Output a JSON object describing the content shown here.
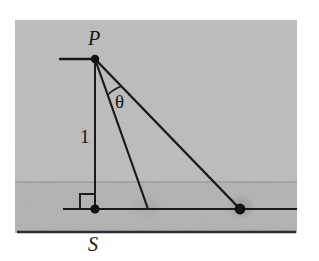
{
  "figure": {
    "panel": {
      "x": 15,
      "y": 20,
      "width": 282,
      "height": 213,
      "upper_fill": "#bcbcbc",
      "lower_fill": "#b2b2b2",
      "band_divider_y": 182,
      "border_color": "#6f6f6f"
    },
    "stroke_color": "#1a1a1a",
    "labels": {
      "apex": "P",
      "angle": "θ",
      "height": "1",
      "base_point": "S"
    },
    "points": {
      "apex": {
        "name": "P",
        "x": 95,
        "y": 59,
        "dot": true,
        "dot_r": 4.2
      },
      "foot": {
        "name": "S",
        "x": 95,
        "y": 209,
        "dot": true,
        "dot_r": 4.6
      },
      "near_target": {
        "name": "near-ray-endpoint",
        "x": 148,
        "y": 209,
        "dot": false
      },
      "far_target": {
        "name": "far-ray-endpoint",
        "x": 240,
        "y": 209,
        "dot": true,
        "dot_r": 5.4
      }
    },
    "segments": {
      "apex_tick": {
        "x1": 60,
        "y1": 59,
        "x2": 95,
        "y2": 59,
        "width": 2.4
      },
      "height_line": {
        "x1": 95,
        "y1": 59,
        "x2": 95,
        "y2": 209,
        "width": 2.0
      },
      "ground_line": {
        "x1": 63,
        "y1": 209,
        "x2": 297,
        "y2": 209,
        "width": 2.0
      },
      "near_ray": {
        "x1": 95,
        "y1": 59,
        "x2": 148,
        "y2": 209,
        "width": 2.2
      },
      "far_ray": {
        "x1": 95,
        "y1": 59,
        "x2": 240,
        "y2": 209,
        "width": 2.4
      },
      "panel_base": {
        "x1": 17,
        "y1": 232,
        "x2": 296,
        "y2": 232,
        "width": 2.6
      }
    },
    "right_angle_mark": {
      "x": 80,
      "y": 194,
      "size": 15,
      "width": 1.9
    },
    "angle_arc": {
      "cx": 95,
      "cy": 59,
      "radius": 38,
      "from_deg": 70.5,
      "to_deg": 45.9,
      "width": 1.6
    },
    "smudges": [
      {
        "name": "near-ray-smudge",
        "cx": 147,
        "cy": 207,
        "rx": 13,
        "ry": 9,
        "fill": "#a9a9a9",
        "opacity": 0.75
      },
      {
        "name": "far-ray-smudge",
        "cx": 241,
        "cy": 207,
        "rx": 11,
        "ry": 10,
        "fill": "#9d9d9d",
        "opacity": 0.7
      }
    ]
  }
}
